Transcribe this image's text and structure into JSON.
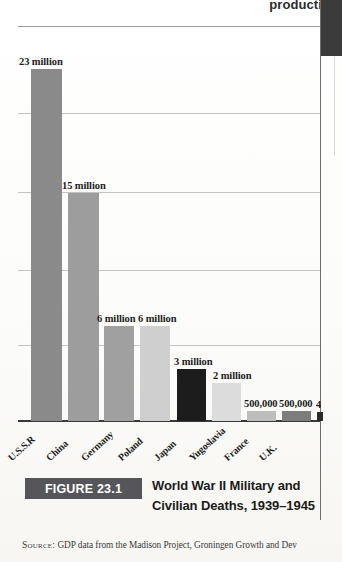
{
  "page": {
    "clipped_heading": "producti",
    "source_prefix": "Source:",
    "source_text": "GDP data from the Madison Project, Groningen Growth and Dev"
  },
  "caption": {
    "figure_tag": "FIGURE 23.1",
    "line1": "World War II Military and",
    "line2": "Civilian Deaths, 1939–1945"
  },
  "colors": {
    "bar_dark_gray": "#8a8a8a",
    "bar_medium_gray": "#9d9d9d",
    "bar_light_gray": "#c9c9c9",
    "bar_black": "#1c1c1c",
    "bar_very_light": "#dcdcdc",
    "figure_tag_bg": "#56565a",
    "axis": "#3a3a3a",
    "gridline": "#9a9a9a",
    "right_block": "#3b3b3b"
  },
  "chart_data": {
    "type": "bar",
    "title": "World War II Military and Civilian Deaths, 1939–1945",
    "xlabel": "",
    "ylabel": "",
    "grid": true,
    "legend": "none",
    "ylim": [
      0,
      26000000
    ],
    "categories": [
      "U.S.S.R",
      "China",
      "Germany",
      "Poland",
      "Japan",
      "Yugoslavia",
      "France",
      "U.K.",
      ""
    ],
    "values": [
      23000000,
      15000000,
      6000000,
      6000000,
      3000000,
      2000000,
      500000,
      500000,
      400000
    ],
    "data_labels": [
      "23 million",
      "15 million",
      "6 million",
      "6 million",
      "3 million",
      "2 million",
      "500,000",
      "500,000",
      "4"
    ],
    "bar_colors": [
      "#8a8a8a",
      "#9d9d9d",
      "#a0a0a0",
      "#cfcfcf",
      "#1c1c1c",
      "#dcdcdc",
      "#bdbdbd",
      "#7d7d7d",
      "#2a2a2a"
    ],
    "bars": [
      {
        "label": "U.S.S.R",
        "value": 23000000,
        "data_label": "23 million",
        "left": 31,
        "width": 31,
        "height": 352,
        "color": "#8a8a8a",
        "label_left": -12,
        "label_top": -13,
        "truncated": false
      },
      {
        "label": "China",
        "value": 15000000,
        "data_label": "15 million",
        "left": 68,
        "width": 31,
        "height": 228,
        "color": "#9d9d9d",
        "label_left": -6,
        "label_top": -13,
        "truncated": false
      },
      {
        "label": "Germany",
        "value": 6000000,
        "data_label": "6 million",
        "left": 104,
        "width": 30,
        "height": 95,
        "color": "#a0a0a0",
        "label_left": -7,
        "label_top": -13,
        "truncated": false
      },
      {
        "label": "Poland",
        "value": 6000000,
        "data_label": "6 million",
        "left": 140,
        "width": 30,
        "height": 95,
        "color": "#cfcfcf",
        "label_left": -2,
        "label_top": -13,
        "truncated": false
      },
      {
        "label": "Japan",
        "value": 3000000,
        "data_label": "3 million",
        "left": 177,
        "width": 29,
        "height": 52,
        "color": "#1c1c1c",
        "label_left": -3,
        "label_top": -13,
        "truncated": false
      },
      {
        "label": "Yugoslavia",
        "value": 2000000,
        "data_label": "2 million",
        "left": 212,
        "width": 29,
        "height": 38,
        "color": "#dcdcdc",
        "label_left": 1,
        "label_top": -13,
        "truncated": false
      },
      {
        "label": "France",
        "value": 500000,
        "data_label": "500,000",
        "left": 247,
        "width": 29,
        "height": 10,
        "color": "#bdbdbd",
        "label_left": -3,
        "label_top": -13,
        "truncated": false
      },
      {
        "label": "U.K.",
        "value": 500000,
        "data_label": "500,000",
        "left": 282,
        "width": 29,
        "height": 10,
        "color": "#7d7d7d",
        "label_left": -3,
        "label_top": -13,
        "truncated": false
      },
      {
        "label": "",
        "value": 400000,
        "data_label": "4",
        "left": 317,
        "width": 6,
        "height": 9,
        "color": "#2a2a2a",
        "label_left": -1,
        "label_top": -13,
        "truncated": true
      }
    ],
    "gridlines": [
      26,
      113,
      192,
      270,
      345
    ],
    "baseline_y": 420,
    "xtick_labels": [
      "U.S.S.R",
      "China",
      "Germany",
      "Poland",
      "Japan",
      "Yugoslavia",
      "France",
      "U.K."
    ],
    "xtick_positions": [
      40,
      78,
      113,
      150,
      186,
      221,
      256,
      291
    ]
  }
}
